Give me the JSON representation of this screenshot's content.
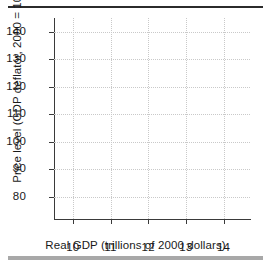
{
  "chart_data": {
    "type": "scatter",
    "title": "",
    "subtitle": "",
    "xlabel": "Real GDP (trillions of 2000 dollars)",
    "ylabel": "Price level (GDP deflator, 2000 = 100)",
    "x_ticks": [
      "10",
      "11",
      "12",
      "13",
      "14"
    ],
    "y_ticks": [
      "80",
      "90",
      "100",
      "110",
      "120",
      "130",
      "140"
    ],
    "xlim": [
      9.5,
      14.7
    ],
    "ylim": [
      72,
      145
    ],
    "grid": true,
    "legend": null,
    "series": [
      {
        "name": "",
        "x": [],
        "y": []
      }
    ],
    "annotations": [],
    "note": "Empty grid — axes drawn with no plotted data points",
    "colors": {
      "axis": "#3a3a3a",
      "grid": "#c9c9c9",
      "rule": "#2b2b2b",
      "footer_bar": "#a8a8a8",
      "text": "#1a1a1a",
      "background": "#ffffff"
    }
  },
  "figure": {
    "top_rule_name": "top-divider",
    "bottom_bar_name": "bottom-divider"
  }
}
